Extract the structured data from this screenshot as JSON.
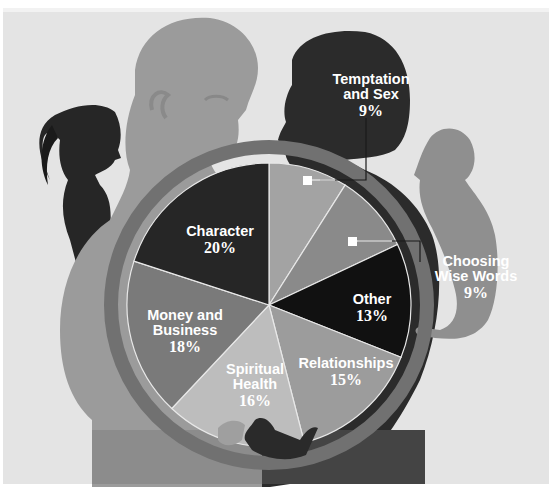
{
  "chart_data": {
    "type": "pie",
    "title": "",
    "start_angle_deg": 0,
    "direction": "clockwise",
    "categories": [
      "Temptation and Sex",
      "Choosing Wise Words",
      "Other",
      "Relationships",
      "Spiritual Health",
      "Money and Business",
      "Character"
    ],
    "values": [
      9,
      9,
      13,
      15,
      16,
      18,
      20
    ],
    "unit": "%",
    "slices": [
      {
        "label": "Temptation and Sex",
        "name_line1": "Temptation",
        "name_line2": "and Sex",
        "value": 9,
        "pct_text": "9%",
        "color": "#a3a3a3",
        "callout": true
      },
      {
        "label": "Choosing Wise Words",
        "name_line1": "Choosing",
        "name_line2": "Wise Words",
        "value": 9,
        "pct_text": "9%",
        "color": "#8a8a8a",
        "callout": true
      },
      {
        "label": "Other",
        "name_line1": "Other",
        "name_line2": "",
        "value": 13,
        "pct_text": "13%",
        "color": "#111111",
        "callout": false
      },
      {
        "label": "Relationships",
        "name_line1": "Relationships",
        "name_line2": "",
        "value": 15,
        "pct_text": "15%",
        "color": "#9c9c9c",
        "callout": false
      },
      {
        "label": "Spiritual Health",
        "name_line1": "Spiritual",
        "name_line2": "Health",
        "value": 16,
        "pct_text": "16%",
        "color": "#bdbdbd",
        "callout": false
      },
      {
        "label": "Money and Business",
        "name_line1": "Money and",
        "name_line2": "Business",
        "value": 18,
        "pct_text": "18%",
        "color": "#7a7a7a",
        "callout": false
      },
      {
        "label": "Character",
        "name_line1": "Character",
        "name_line2": "",
        "value": 20,
        "pct_text": "20%",
        "color": "#262626",
        "callout": false
      }
    ],
    "legend": "none (direct labels)",
    "grid": false
  },
  "colors": {
    "background": "#ffffff",
    "bg_panel": "#dcdcdc",
    "man_silhouette": "#9a9a9a",
    "woman_silhouette": "#2b2b2b",
    "girl_silhouette": "#262626",
    "boy_silhouette": "#8f8f8f",
    "ring": "#6e6e6e",
    "slice_border": "#e8e8e8",
    "label_text": "#ffffff"
  }
}
